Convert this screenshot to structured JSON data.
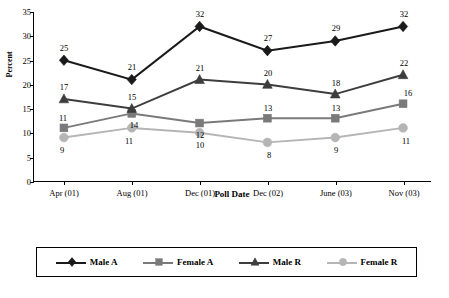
{
  "chart_data": {
    "type": "line",
    "title": "",
    "xlabel": "Poll Date",
    "ylabel": "Percent",
    "categories": [
      "Apr (01)",
      "Aug (01)",
      "Dec (01)",
      "Dec (02)",
      "June (03)",
      "Nov (03)"
    ],
    "ylim": [
      0,
      35
    ],
    "yticks": [
      0,
      5,
      10,
      15,
      20,
      25,
      30,
      35
    ],
    "grid": false,
    "legend_position": "bottom",
    "series": [
      {
        "name": "Male A",
        "color": "#1a1a1a",
        "marker": "diamond",
        "values": [
          25,
          21,
          32,
          27,
          29,
          32
        ],
        "labels": [
          "25",
          "21",
          "32",
          "27",
          "29",
          "32"
        ]
      },
      {
        "name": "Female A",
        "color": "#7a7a7a",
        "marker": "square",
        "values": [
          11,
          14,
          12,
          13,
          13,
          16
        ],
        "labels": [
          "11",
          "14",
          "12",
          "13",
          "13",
          "16"
        ]
      },
      {
        "name": "Male R",
        "color": "#3d3d3d",
        "marker": "triangle",
        "values": [
          17,
          15,
          21,
          20,
          18,
          22
        ],
        "labels": [
          "17",
          "15",
          "21",
          "20",
          "18",
          "22"
        ]
      },
      {
        "name": "Female R",
        "color": "#b5b5b5",
        "marker": "circle",
        "values": [
          9,
          11,
          10,
          8,
          9,
          11
        ],
        "labels": [
          "9",
          "11",
          "10",
          "8",
          "9",
          "11"
        ]
      }
    ]
  }
}
